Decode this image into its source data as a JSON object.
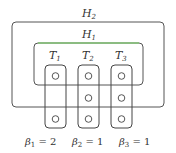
{
  "diagram": {
    "outer_label": "H",
    "outer_sub": "2",
    "inner_label": "H",
    "inner_sub": "1",
    "inner_border_color": "#6fcf5a",
    "box_color": "#444444",
    "columns": [
      {
        "label": "T",
        "sub": "1",
        "circles": 2,
        "beta_label": "β",
        "beta_sub": "1",
        "beta_value": " = 2"
      },
      {
        "label": "T",
        "sub": "2",
        "circles": 3,
        "beta_label": "β",
        "beta_sub": "2",
        "beta_value": " = 1"
      },
      {
        "label": "T",
        "sub": "3",
        "circles": 3,
        "beta_label": "β",
        "beta_sub": "3",
        "beta_value": " = 1"
      }
    ]
  }
}
